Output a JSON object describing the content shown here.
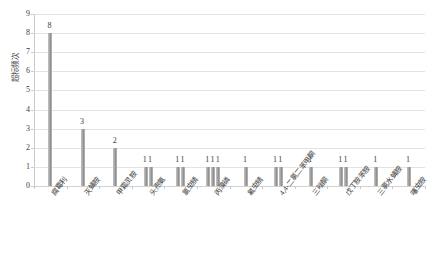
{
  "chart_data": {
    "type": "bar",
    "title": "",
    "xlabel": "",
    "ylabel": "超标频次",
    "ylim": [
      0,
      9
    ],
    "yticks": [
      0,
      1,
      2,
      3,
      4,
      5,
      6,
      7,
      8,
      9
    ],
    "grid": true,
    "legend": "none",
    "categories": [
      "腐霉利",
      "灭蝇胺",
      "甲霜灵胺",
      "头孢氨",
      "氯虫腈",
      "丙溴磷",
      "氟虫腈",
      "4,4-二氯二苯甲酮",
      "三唑酮",
      "戊丁胺苯胺",
      "三氯水蝇胺",
      "噻虫胺"
    ],
    "group_values": [
      [
        8
      ],
      [
        3
      ],
      [
        2
      ],
      [
        1,
        1
      ],
      [
        1,
        1
      ],
      [
        1,
        1,
        1
      ],
      [
        1
      ],
      [
        1,
        1
      ],
      [
        1
      ],
      [
        1,
        1
      ],
      [
        1
      ],
      [
        1
      ]
    ],
    "group_labels": [
      "8",
      "3",
      "2",
      "11",
      "11",
      "111",
      "1",
      "11",
      "1",
      "11",
      "1",
      "1"
    ],
    "colors": {
      "bar": "#a9a9a9",
      "gridline": "#e3e3e3",
      "axis": "#c9c9c9",
      "text": "#3a3a3a",
      "background": "#ffffff"
    }
  }
}
